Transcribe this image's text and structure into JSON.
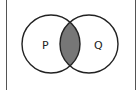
{
  "diagram": {
    "type": "venn",
    "sets": [
      {
        "label": "P",
        "cx": 51,
        "cy": 44,
        "r": 29
      },
      {
        "label": "Q",
        "cx": 89,
        "cy": 44,
        "r": 29
      }
    ],
    "shaded_region": "P ∩ Q",
    "colors": {
      "stroke": "#222222",
      "shade": "#777777",
      "border": "#555555",
      "background": "#ffffff"
    }
  }
}
